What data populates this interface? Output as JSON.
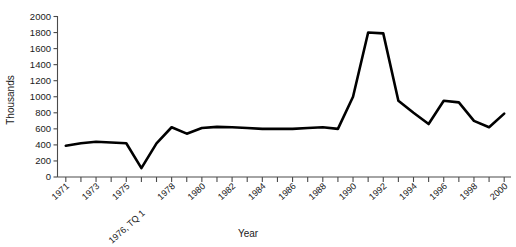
{
  "chart_data": {
    "type": "line",
    "title": "",
    "xlabel": "Year",
    "ylabel": "Thousands",
    "ylim": [
      0,
      2000
    ],
    "ytick_values": [
      0,
      200,
      400,
      600,
      800,
      1000,
      1200,
      1400,
      1600,
      1800,
      2000
    ],
    "grid": false,
    "legend": false,
    "categories": [
      "1971",
      "1972",
      "1973",
      "1974",
      "1975",
      "1976, TQ 1",
      "1977",
      "1978",
      "1979",
      "1980",
      "1981",
      "1982",
      "1983",
      "1984",
      "1985",
      "1986",
      "1987",
      "1988",
      "1989",
      "1990",
      "1991",
      "1992",
      "1993",
      "1994",
      "1995",
      "1996",
      "1997",
      "1998",
      "1999",
      "2000"
    ],
    "xtick_labels_shown": [
      "1971",
      "1973",
      "1975",
      "1976, TQ 1",
      "1978",
      "1980",
      "1982",
      "1984",
      "1986",
      "1988",
      "1990",
      "1992",
      "1994",
      "1996",
      "1998",
      "2000"
    ],
    "values": [
      390,
      420,
      440,
      430,
      420,
      110,
      420,
      620,
      540,
      610,
      625,
      620,
      610,
      600,
      600,
      600,
      610,
      620,
      600,
      1000,
      1800,
      1790,
      950,
      800,
      660,
      950,
      930,
      700,
      620,
      790
    ],
    "annotations": []
  },
  "axis": {
    "y_label_text": "Thousands",
    "x_label_text": "Year"
  }
}
